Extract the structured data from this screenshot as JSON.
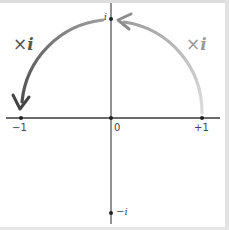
{
  "diagram": {
    "axes": {
      "real_ticks": [
        {
          "id": "neg_one",
          "label": "−1",
          "value": -1
        },
        {
          "id": "zero",
          "label": "0",
          "value": 0
        },
        {
          "id": "pos_one",
          "label": "+1",
          "value": 1
        }
      ],
      "imag_ticks": [
        {
          "id": "i",
          "label": "i",
          "value": 1
        },
        {
          "id": "neg_i",
          "label": "−i",
          "value": -1
        }
      ]
    },
    "arcs": [
      {
        "id": "right_arc",
        "from": "+1",
        "to": "i",
        "label_sign": "×",
        "label_i": "i",
        "color": "#a8a8a8"
      },
      {
        "id": "left_arc",
        "from": "i",
        "to": "-1",
        "label_sign": "×",
        "label_i": "i",
        "color": "#555555"
      }
    ],
    "colors": {
      "axis": "#3a3a3a",
      "border": "#d8d8d8",
      "background": "#ffffff",
      "left_arc": "#555555",
      "right_arc": "#a8a8a8"
    }
  }
}
